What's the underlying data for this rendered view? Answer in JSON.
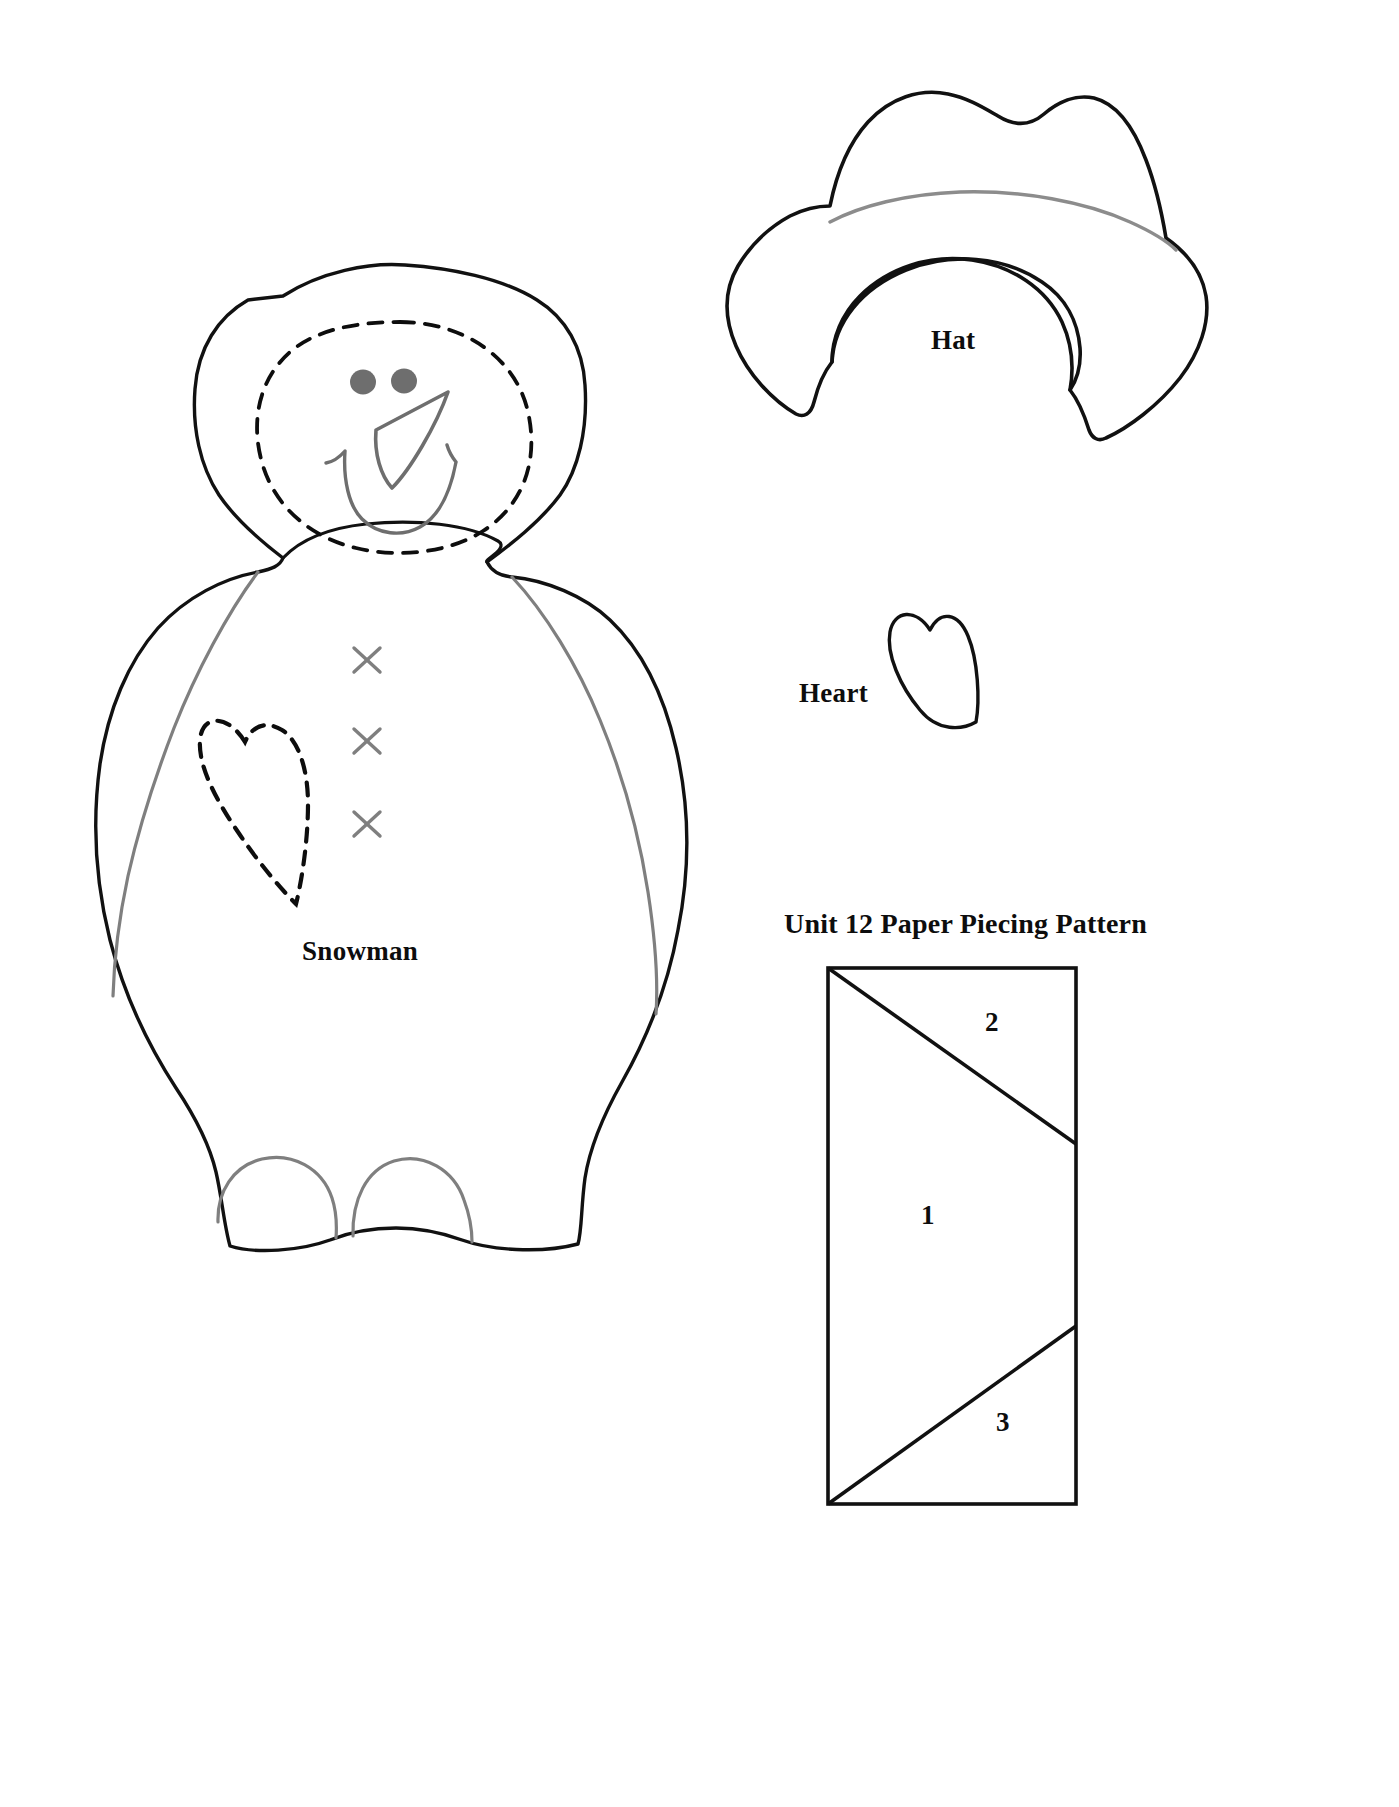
{
  "page": {
    "background_color": "#ffffff",
    "width": 1399,
    "height": 1807,
    "type": "applique-pattern-sheet"
  },
  "colors": {
    "outline_black": "#111111",
    "guide_gray": "#7f7f7f",
    "hatband_gray": "#8c8c8c",
    "face_feature_gray": "#6e6e6e",
    "dash_black": "#0d0d0d"
  },
  "pieces": {
    "snowman": {
      "label": "Snowman",
      "description": "Large snowman body with brimmed hat, dashed face oval, two eyes, carrot nose, smile, three cross stitches and a dashed heart",
      "eye_count": 2,
      "cross_stitch_count": 3,
      "foot_count": 2
    },
    "hat": {
      "label": "Hat",
      "description": "Cowboy style hat with wavy crown, gray hat band line and curled brim"
    },
    "heart": {
      "label": "Heart",
      "description": "Small tilted heart applique piece"
    }
  },
  "unit_pattern": {
    "title": "Unit 12 Paper Piecing Pattern",
    "shape": "rectangle",
    "regions": [
      {
        "number": "1",
        "position": "center"
      },
      {
        "number": "2",
        "position": "top-right"
      },
      {
        "number": "3",
        "position": "bottom-right"
      }
    ]
  }
}
